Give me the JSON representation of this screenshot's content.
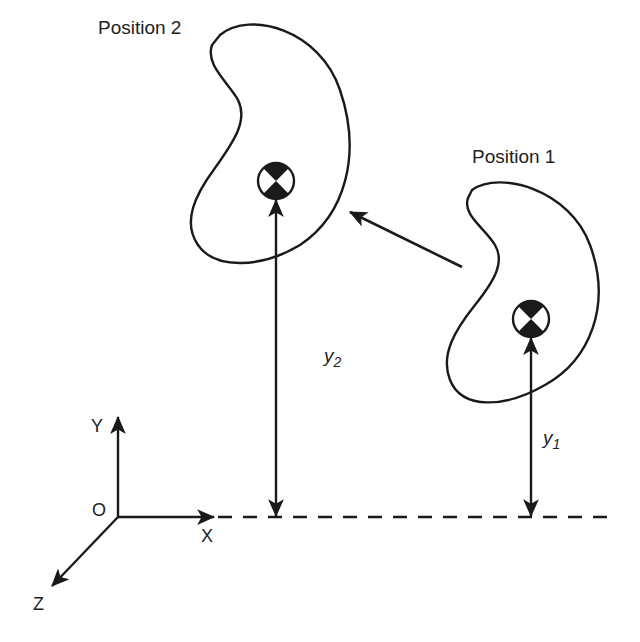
{
  "labels": {
    "position_2": "Position 2",
    "position_1": "Position 1",
    "y2_base": "y",
    "y2_sub": "2",
    "y1_base": "y",
    "y1_sub": "1",
    "axis_y": "Y",
    "axis_x": "X",
    "axis_z": "Z",
    "origin": "O"
  },
  "colors": {
    "stroke": "#1a1a1a",
    "background": "#ffffff"
  },
  "bodies": [
    {
      "name": "position-2",
      "center_of_mass": [
        276,
        181
      ]
    },
    {
      "name": "position-1",
      "center_of_mass": [
        531,
        319
      ]
    }
  ],
  "reference_line_y": 517
}
